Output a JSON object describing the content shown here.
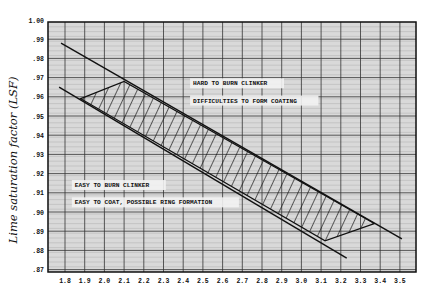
{
  "chart_data": {
    "type": "line",
    "title": "",
    "xlabel": "",
    "ylabel": "Lime saturation factor (LSF)",
    "xlim": [
      1.7,
      3.6
    ],
    "ylim": [
      0.87,
      1.0
    ],
    "grid": true,
    "x_ticks": [
      "1.8",
      "1.9",
      "2.0",
      "2.1",
      "2.2",
      "2.3",
      "2.4",
      "2.5",
      "2.6",
      "2.7",
      "2.8",
      "2.9",
      "3.0",
      "3.1",
      "3.2",
      "3.3",
      "3.4",
      "3.5"
    ],
    "y_ticks": [
      "1.00",
      ".99",
      ".98",
      ".97",
      ".96",
      ".95",
      ".94",
      ".93",
      ".92",
      ".91",
      ".90",
      ".89",
      ".88",
      ".87"
    ],
    "series": [
      {
        "name": "upper boundary line",
        "points": [
          [
            1.78,
            0.988
          ],
          [
            3.51,
            0.886
          ]
        ]
      },
      {
        "name": "lower boundary line",
        "points": [
          [
            1.77,
            0.965
          ],
          [
            3.23,
            0.876
          ]
        ]
      }
    ],
    "hatched_region": {
      "name": "recommended zone",
      "vertices": [
        [
          1.88,
          0.959
        ],
        [
          2.1,
          0.968
        ],
        [
          3.37,
          0.894
        ],
        [
          3.12,
          0.885
        ]
      ]
    },
    "annotations": [
      {
        "text": "HARD TO BURN CLINKER",
        "x": 2.45,
        "y": 0.966
      },
      {
        "text": "DIFFICULTIES TO FORM COATING",
        "x": 2.45,
        "y": 0.957
      },
      {
        "text": "EASY TO BURN CLINKER",
        "x": 1.85,
        "y": 0.913
      },
      {
        "text": "EASY TO COAT, POSSIBLE RING FORMATION",
        "x": 1.85,
        "y": 0.904
      }
    ]
  },
  "colors": {
    "ink": "#111111",
    "grid": "#555555",
    "paper": "#e6e6e6"
  }
}
